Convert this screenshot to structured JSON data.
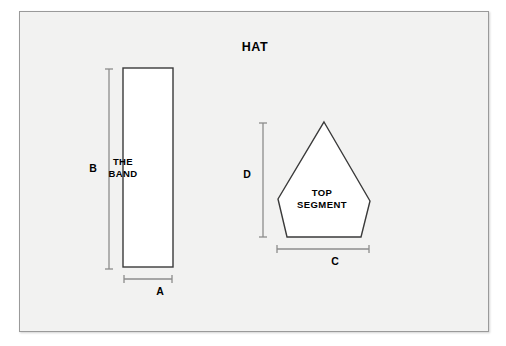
{
  "diagram": {
    "title": "HAT",
    "type": "sewing-pattern-diagram",
    "background_color": "#f2f2f1",
    "frame_border_color": "#9a9a9a",
    "shape_stroke_color": "#3a3a3a",
    "shape_fill_color": "#ffffff",
    "dimension_line_color": "#808080",
    "text_color": "#000000",
    "pieces": [
      {
        "id": "band",
        "label": "THE\nBAND",
        "label_line_1": "THE",
        "label_line_2": "BAND",
        "shape": "rectangle",
        "dimensions": [
          {
            "letter": "A",
            "orientation": "horizontal",
            "describes": "band width"
          },
          {
            "letter": "B",
            "orientation": "vertical",
            "describes": "band length"
          }
        ]
      },
      {
        "id": "top-segment",
        "label": "TOP\nSEGMENT",
        "label_line_1": "TOP",
        "label_line_2": "SEGMENT",
        "shape": "pentagon",
        "dimensions": [
          {
            "letter": "C",
            "orientation": "horizontal",
            "describes": "segment base width"
          },
          {
            "letter": "D",
            "orientation": "vertical",
            "describes": "segment height"
          }
        ]
      }
    ],
    "dimension_letters": {
      "a": "A",
      "b": "B",
      "c": "C",
      "d": "D"
    }
  }
}
